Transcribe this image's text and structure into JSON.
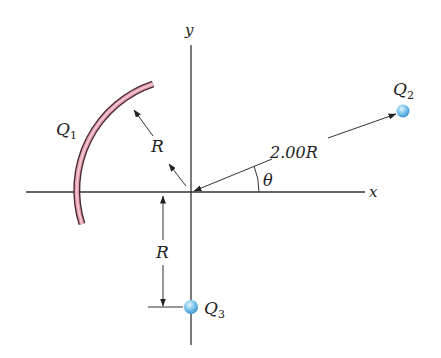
{
  "diagram": {
    "axes": {
      "x_label": "x",
      "y_label": "y"
    },
    "charges": {
      "q1": {
        "label": "Q",
        "sub": "1",
        "shape": "arc"
      },
      "q2": {
        "label": "Q",
        "sub": "2",
        "shape": "point"
      },
      "q3": {
        "label": "Q",
        "sub": "3",
        "shape": "point"
      }
    },
    "dimensions": {
      "arc_radius": "R",
      "q3_distance": "R",
      "q2_distance": "2.00R",
      "angle": "θ"
    },
    "colors": {
      "arc_fill": "#e8a0b0",
      "arc_edge": "#4a2a33",
      "charge_fill": "#7cc4ea",
      "axis": "#333333"
    }
  }
}
